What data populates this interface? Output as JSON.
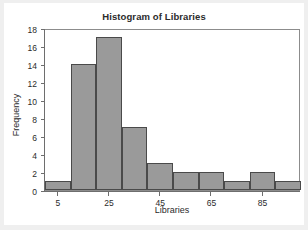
{
  "chart_data": {
    "type": "bar",
    "title": "Histogram of Libraries",
    "xlabel": "Libraries",
    "ylabel": "Frequency",
    "bin_width": 10,
    "bin_starts": [
      0,
      10,
      20,
      30,
      40,
      50,
      60,
      70,
      80,
      90
    ],
    "bin_labels": [
      "0-10",
      "10-20",
      "20-30",
      "30-40",
      "40-50",
      "50-60",
      "60-70",
      "70-80",
      "80-90",
      "90-100"
    ],
    "values": [
      1,
      14,
      17,
      7,
      3,
      2,
      2,
      1,
      2,
      1
    ],
    "xlim": [
      0,
      100
    ],
    "ylim": [
      0,
      18
    ],
    "xticks": [
      5,
      25,
      45,
      65,
      85
    ],
    "xtick_labels": [
      "5",
      "25",
      "45",
      "65",
      "85"
    ],
    "yticks": [
      0,
      2,
      4,
      6,
      8,
      10,
      12,
      14,
      16,
      18
    ],
    "ytick_labels": [
      "0",
      "2",
      "4",
      "6",
      "8",
      "10",
      "12",
      "14",
      "16",
      "18"
    ],
    "grid": false,
    "legend": null,
    "bar_fill": "#9a9a9a",
    "bar_edge": "#4a4a4a"
  }
}
